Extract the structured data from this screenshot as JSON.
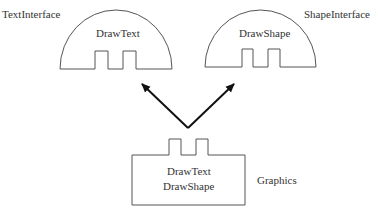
{
  "diagram": {
    "interfaces": [
      {
        "name": "TextInterface",
        "method": "DrawText"
      },
      {
        "name": "ShapeInterface",
        "method": "DrawShape"
      }
    ],
    "component": {
      "name": "Graphics",
      "methods": [
        "DrawText",
        "DrawShape"
      ]
    },
    "colors": {
      "stroke": "#555555",
      "arrow": "#111111",
      "text": "#333333"
    }
  }
}
